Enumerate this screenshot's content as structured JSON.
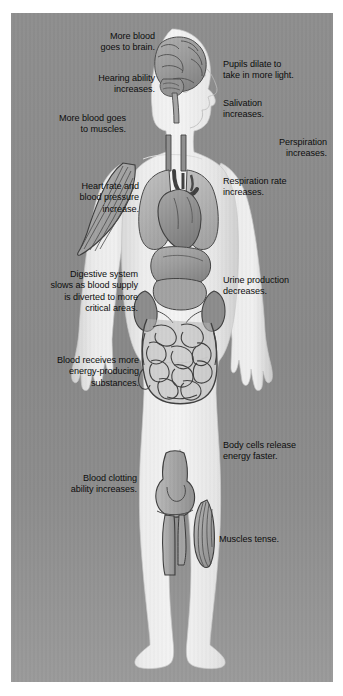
{
  "figure": {
    "panel_background_color": "#8b8b8b",
    "body_fill_color": "#ececec",
    "organ_fill_color": "#9d9d9d",
    "outline_color": "#3a3a3a",
    "text_color": "#0d0d0d"
  },
  "labels": {
    "brain_blood": "More blood\ngoes to brain.",
    "hearing": "Hearing ability\nincreases.",
    "muscles_blood": "More blood goes\nto muscles.",
    "heart_rate": "Heart rate and\nblood pressure\nincrease.",
    "digestion": "Digestive system\nslows as blood supply\nis diverted to more\ncritical areas.",
    "blood_energy": "Blood receives more\nenergy-producing\nsubstances.",
    "clotting": "Blood clotting\nability increases.",
    "pupils": "Pupils dilate to\ntake in more light.",
    "salivation": "Salivation\nincreases.",
    "perspiration": "Perspiration\nincreases.",
    "respiration": "Respiration rate\nincreases.",
    "urine": "Urine production\ndecreases.",
    "cells_energy": "Body cells release\nenergy faster.",
    "muscles_tense": "Muscles tense."
  },
  "anatomy_parts": [
    "brain",
    "spinal-cord",
    "trachea",
    "lungs",
    "heart",
    "aorta",
    "liver",
    "stomach",
    "kidneys",
    "intestines",
    "biceps-muscle",
    "knee-joint",
    "calf-muscle"
  ]
}
